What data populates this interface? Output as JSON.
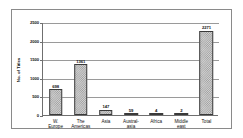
{
  "chart_data": {
    "type": "bar",
    "title": "",
    "xlabel": "",
    "ylabel": "No. of Titles",
    "ylim": [
      0,
      2500
    ],
    "ytick_labels": [
      "2500",
      "2000",
      "1500",
      "1000",
      "500",
      "0"
    ],
    "ytick_values": [
      2500,
      2000,
      1500,
      1000,
      500,
      0
    ],
    "grid": true,
    "legend": "none",
    "categories": [
      "W.\nEurope",
      "The\nAmericas",
      "Asia",
      "Austral-\nasia",
      "Africa",
      "Middle\neast",
      "Total"
    ],
    "values": [
      698,
      1361,
      147,
      59,
      4,
      2,
      2271
    ],
    "data_labels": [
      "698",
      "1361",
      "147",
      "59",
      "4",
      "2",
      "2271"
    ],
    "series": [
      {
        "name": "No. of Titles",
        "values": [
          698,
          1361,
          147,
          59,
          4,
          2,
          2271
        ]
      }
    ],
    "colors": {
      "bar_fill": "#d0d0d0",
      "bar_hatch": "#9d9d9d",
      "bar_border": "#3a3a3a",
      "gridline": "#9a9a9a",
      "axis": "#6f6f6f",
      "frame": "#8a8a8a",
      "text": "#111111",
      "background": "#ffffff"
    }
  }
}
